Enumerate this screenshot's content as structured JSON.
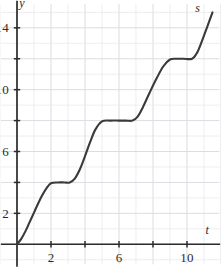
{
  "figure": {
    "background_color": "#ffffff",
    "grid_color": "#e6e6ea",
    "grid_major_color": "#dcdce2",
    "axis_color": "#2b2b2b",
    "curve_color": "#3a3a3a",
    "width": 221,
    "height": 269
  },
  "chart_data": {
    "type": "line",
    "title": "",
    "subtitle": "",
    "xlabel": "t",
    "ylabel": "y",
    "series_label": "s",
    "xlim": [
      -1,
      12
    ],
    "ylim": [
      -1.6,
      15.8
    ],
    "grid": true,
    "legend_position": "inline-curve-end",
    "x_ticks": [
      2,
      4,
      6,
      8,
      10
    ],
    "x_tick_labels": [
      "2",
      "",
      "6",
      "",
      "10"
    ],
    "y_ticks": [
      2,
      4,
      6,
      8,
      10,
      12,
      14
    ],
    "y_tick_labels": [
      "2",
      "",
      "6",
      "",
      "10",
      "",
      "14"
    ],
    "x_grid_values": [
      -1,
      0,
      1,
      2,
      3,
      4,
      5,
      6,
      7,
      8,
      9,
      10,
      11,
      12
    ],
    "y_grid_values": [
      -1,
      0,
      1,
      2,
      3,
      4,
      5,
      6,
      7,
      8,
      9,
      10,
      11,
      12,
      13,
      14,
      15
    ],
    "plateaus": [
      {
        "y": 4,
        "x_start": 2.0,
        "x_end": 3.1
      },
      {
        "y": 8,
        "x_start": 5.0,
        "x_end": 6.8
      },
      {
        "y": 12,
        "x_start": 9.0,
        "x_end": 10.3
      }
    ],
    "x": [
      0.0,
      0.25,
      0.5,
      0.75,
      1.0,
      1.25,
      1.5,
      1.75,
      2.0,
      2.4,
      2.8,
      3.1,
      3.4,
      3.7,
      4.0,
      4.3,
      4.6,
      5.0,
      5.5,
      6.0,
      6.4,
      6.8,
      7.1,
      7.4,
      7.8,
      8.2,
      8.6,
      9.0,
      9.4,
      9.8,
      10.3,
      10.6,
      10.9,
      11.2,
      11.5
    ],
    "y": [
      0.0,
      0.35,
      0.85,
      1.45,
      2.05,
      2.65,
      3.2,
      3.65,
      3.95,
      4.0,
      4.0,
      4.0,
      4.25,
      4.85,
      5.7,
      6.6,
      7.4,
      7.95,
      8.0,
      8.0,
      8.0,
      8.0,
      8.25,
      8.85,
      9.8,
      10.7,
      11.5,
      11.95,
      12.0,
      12.0,
      12.0,
      12.4,
      13.2,
      14.1,
      15.0
    ],
    "annotations": [
      {
        "text": "s",
        "x": 10.6,
        "y": 15.3,
        "italic": true
      },
      {
        "text": "y",
        "x": 0.25,
        "y": 15.6,
        "italic": true
      },
      {
        "text": "t",
        "x": 11.2,
        "y": 0.95,
        "italic": true
      }
    ]
  },
  "axes": {
    "x_axis_name": "t",
    "y_axis_name": "y",
    "curve_name": "s"
  }
}
